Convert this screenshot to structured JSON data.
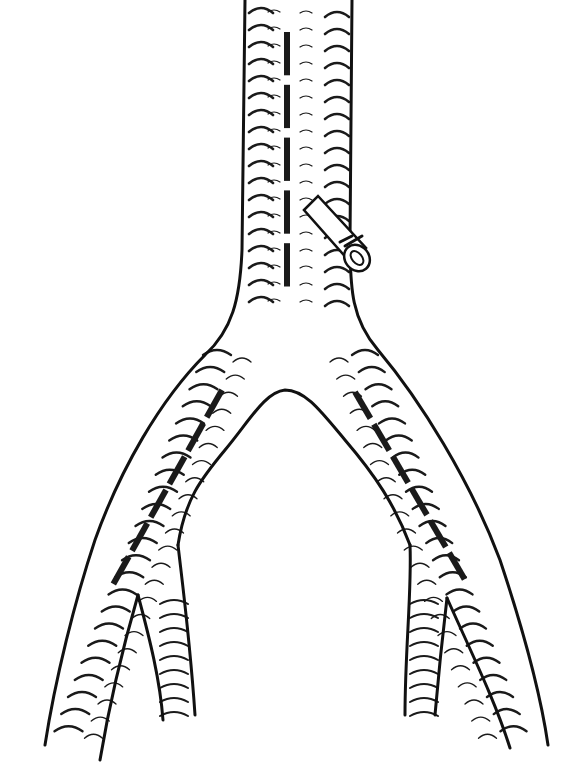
{
  "figure": {
    "width": 566,
    "height": 766,
    "colors": {
      "ink": "#111111",
      "background": "#ffffff"
    }
  },
  "vessels": {
    "aorta": {
      "left_wall_x": 245,
      "right_wall_x": 352,
      "top_y": 0,
      "bifurcation_y": 320
    },
    "left_iliac": {
      "outer_end": [
        45,
        740
      ],
      "inner_end": [
        135,
        760
      ]
    },
    "right_iliac": {
      "outer_end": [
        548,
        745
      ],
      "inner_end": [
        500,
        745
      ]
    },
    "left_internal_branch": {
      "end": [
        160,
        720
      ]
    },
    "right_internal_branch": {
      "end": [
        410,
        715
      ]
    }
  },
  "suture_lines": [
    {
      "name": "aortic-incision",
      "from": [
        287,
        32
      ],
      "to": [
        287,
        296
      ],
      "segments": 5
    },
    {
      "name": "left-iliac-incision",
      "from": [
        222,
        390
      ],
      "to": [
        110,
        590
      ],
      "segments": 6
    },
    {
      "name": "right-iliac-incision",
      "from": [
        355,
        392
      ],
      "to": [
        468,
        585
      ],
      "segments": 6
    }
  ],
  "side_branch": {
    "name": "ligated-lumbar-branch",
    "center": [
      356,
      258
    ],
    "label": ""
  }
}
